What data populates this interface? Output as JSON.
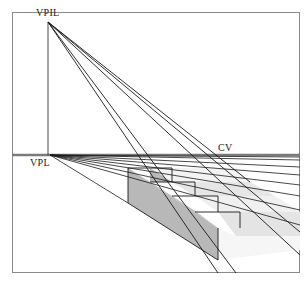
{
  "figure": {
    "type": "perspective-construction-diagram",
    "labels": {
      "vpil": "VPIL",
      "vpl": "VPL",
      "cv": "CV"
    },
    "colors": {
      "line": "#1a1a1a",
      "frame": "#8a8a8a",
      "horizon": "#7a7a7a",
      "side_shade": "#b4b4b4",
      "tread_shade": "#e2e2e2",
      "riser_light": "#f2f2f2"
    },
    "points": {
      "vpil": [
        48,
        22
      ],
      "vpl": [
        50,
        155
      ],
      "frame": {
        "left": 12,
        "top": 12,
        "right": 300,
        "bottom": 273
      },
      "horizon_y": 155
    },
    "caption": "Figure — Staircase in perspective"
  }
}
